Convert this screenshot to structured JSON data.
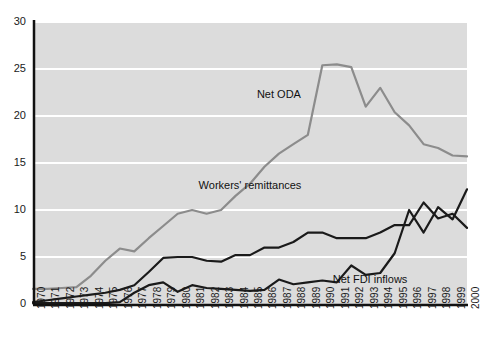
{
  "chart_data": {
    "type": "line",
    "title": "",
    "subtitle": "",
    "xlabel": "",
    "ylabel": "",
    "xlim": [
      1970,
      2000
    ],
    "ylim": [
      0,
      30
    ],
    "yticks": [
      0,
      5,
      10,
      15,
      20,
      25,
      30
    ],
    "grid": true,
    "legend_position": "inline-annotations",
    "x": [
      1970,
      1971,
      1972,
      1973,
      1974,
      1975,
      1976,
      1977,
      1978,
      1979,
      1980,
      1981,
      1982,
      1983,
      1984,
      1985,
      1986,
      1987,
      1988,
      1989,
      1990,
      1991,
      1992,
      1993,
      1994,
      1995,
      1996,
      1997,
      1998,
      1999,
      2000
    ],
    "categories": [
      "1970",
      "1971",
      "1972",
      "1973",
      "1974",
      "1975",
      "1976",
      "1977",
      "1978",
      "1979",
      "1980",
      "1981",
      "1982",
      "1983",
      "1984",
      "1985",
      "1986",
      "1987",
      "1988",
      "1989",
      "1990",
      "1991",
      "1992",
      "1993",
      "1994",
      "1995",
      "1996",
      "1997",
      "1998",
      "1999",
      "2000"
    ],
    "series": [
      {
        "name": "Net ODA",
        "color": "#8c8c8c",
        "label_x": 1987.0,
        "label_y": 22.2,
        "values": [
          1.6,
          1.6,
          1.7,
          1.8,
          3.0,
          4.6,
          5.9,
          5.6,
          7.0,
          8.3,
          9.6,
          10.0,
          9.6,
          10.0,
          11.5,
          12.8,
          14.6,
          16.0,
          17.0,
          18.0,
          25.4,
          25.5,
          25.2,
          21.0,
          23.0,
          20.4,
          19.0,
          17.0,
          16.6,
          15.8,
          15.7
        ]
      },
      {
        "name": "Workers' remittances",
        "color": "#1a1a1a",
        "label_x": 1985.0,
        "label_y": 12.6,
        "values": [
          0.2,
          0.4,
          0.6,
          0.8,
          1.0,
          1.2,
          1.5,
          2.0,
          3.4,
          4.9,
          5.0,
          5.0,
          4.6,
          4.5,
          5.2,
          5.2,
          6.0,
          6.0,
          6.6,
          7.6,
          7.6,
          7.0,
          7.0,
          7.0,
          7.6,
          8.4,
          8.4,
          10.8,
          9.1,
          9.6,
          8.1
        ]
      },
      {
        "name": "Net FDI inflows",
        "color": "#1a1a1a",
        "label_x": 1993.3,
        "label_y": 2.6,
        "values": [
          0.1,
          0.1,
          0.1,
          0.1,
          0.1,
          0.1,
          0.2,
          1.2,
          2.0,
          2.3,
          1.3,
          2.0,
          1.7,
          1.6,
          1.5,
          1.4,
          1.5,
          2.6,
          2.1,
          2.3,
          2.5,
          2.3,
          4.1,
          3.1,
          3.3,
          5.4,
          10.0,
          7.6,
          10.3,
          9.0,
          12.2
        ]
      }
    ]
  },
  "axes": {
    "y_tick_labels": [
      "0",
      "5",
      "10",
      "15",
      "20",
      "25",
      "30"
    ],
    "x_tick_labels": [
      "1970",
      "1971",
      "1972",
      "1973",
      "1974",
      "1975",
      "1976",
      "1977",
      "1978",
      "1979",
      "1980",
      "1981",
      "1982",
      "1983",
      "1984",
      "1985",
      "1986",
      "1987",
      "1988",
      "1989",
      "1990",
      "1991",
      "1992",
      "1993",
      "1994",
      "1995",
      "1996",
      "1997",
      "1998",
      "1999",
      "2000"
    ]
  },
  "style": {
    "plot_background": "#dcdcdc",
    "gridline_color": "#ffffff",
    "axis_color": "#111111",
    "oda_color": "#8c8c8c",
    "dark_series_color": "#1a1a1a",
    "page_background": "#ffffff"
  }
}
